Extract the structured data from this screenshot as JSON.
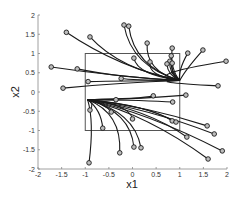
{
  "chart_data": {
    "type": "line",
    "title": "",
    "xlabel": "x1",
    "ylabel": "x2",
    "xlim": [
      -2,
      2
    ],
    "ylim": [
      -2,
      2
    ],
    "xticks": [
      "-2",
      "-1.5",
      "-1",
      "-0.5",
      "0",
      "0.5",
      "1",
      "1.5",
      "2"
    ],
    "yticks": [
      "2",
      "1.5",
      "1",
      "0.5",
      "0",
      "-0.5",
      "-1",
      "-1.5",
      "-2"
    ],
    "grid": false,
    "legend": null,
    "region_box": {
      "x": [
        -1,
        1
      ],
      "y": [
        -1,
        1
      ]
    },
    "attractors": [
      {
        "name": "upper-right",
        "x": 1.0,
        "y": 0.3
      },
      {
        "name": "lower-left",
        "x": -0.95,
        "y": -0.2
      }
    ],
    "trajectories": [
      {
        "start": [
          -1.4,
          1.55
        ],
        "end": [
          1.0,
          0.3
        ]
      },
      {
        "start": [
          -0.18,
          1.74
        ],
        "end": [
          1.0,
          0.3
        ]
      },
      {
        "start": [
          -0.08,
          1.71
        ],
        "end": [
          1.0,
          0.3
        ]
      },
      {
        "start": [
          0.31,
          1.27
        ],
        "end": [
          1.0,
          0.3
        ]
      },
      {
        "start": [
          0.84,
          1.14
        ],
        "end": [
          1.0,
          0.3
        ]
      },
      {
        "start": [
          1.17,
          1.01
        ],
        "end": [
          1.0,
          0.3
        ]
      },
      {
        "start": [
          1.49,
          1.09
        ],
        "end": [
          1.0,
          0.3
        ]
      },
      {
        "start": [
          1.98,
          0.8
        ],
        "end": [
          1.0,
          0.3
        ]
      },
      {
        "start": [
          0.03,
          0.88
        ],
        "end": [
          1.0,
          0.3
        ]
      },
      {
        "start": [
          0.37,
          0.78
        ],
        "end": [
          1.0,
          0.3
        ]
      },
      {
        "start": [
          0.82,
          0.94
        ],
        "end": [
          1.0,
          0.3
        ]
      },
      {
        "start": [
          0.79,
          0.8
        ],
        "end": [
          1.0,
          0.3
        ]
      },
      {
        "start": [
          0.73,
          0.73
        ],
        "end": [
          1.0,
          0.3
        ]
      },
      {
        "start": [
          0.84,
          0.75
        ],
        "end": [
          1.0,
          0.3
        ]
      },
      {
        "start": [
          -0.9,
          1.43
        ],
        "end": [
          1.0,
          0.3
        ]
      },
      {
        "start": [
          -1.72,
          0.65
        ],
        "end": [
          1.0,
          0.3
        ]
      },
      {
        "start": [
          -1.17,
          0.6
        ],
        "end": [
          1.0,
          0.3
        ]
      },
      {
        "start": [
          -0.94,
          0.27
        ],
        "end": [
          1.0,
          0.3
        ]
      },
      {
        "start": [
          -1.47,
          0.1
        ],
        "end": [
          1.0,
          0.3
        ]
      },
      {
        "start": [
          -0.24,
          0.35
        ],
        "end": [
          1.0,
          0.3
        ]
      },
      {
        "start": [
          1.81,
          0.16
        ],
        "end": [
          1.0,
          0.3
        ]
      },
      {
        "start": [
          1.13,
          -0.08
        ],
        "end": [
          -0.95,
          -0.2
        ]
      },
      {
        "start": [
          0.44,
          -0.1
        ],
        "end": [
          -0.95,
          -0.2
        ]
      },
      {
        "start": [
          0.85,
          -0.26
        ],
        "end": [
          -0.95,
          -0.2
        ]
      },
      {
        "start": [
          0.84,
          -0.75
        ],
        "end": [
          -0.95,
          -0.2
        ]
      },
      {
        "start": [
          0.92,
          -0.78
        ],
        "end": [
          -0.95,
          -0.2
        ]
      },
      {
        "start": [
          1.58,
          -0.88
        ],
        "end": [
          -0.95,
          -0.2
        ]
      },
      {
        "start": [
          1.73,
          -1.09
        ],
        "end": [
          -0.95,
          -0.2
        ]
      },
      {
        "start": [
          1.15,
          -1.17
        ],
        "end": [
          -0.95,
          -0.2
        ]
      },
      {
        "start": [
          1.9,
          -1.53
        ],
        "end": [
          -0.95,
          -0.2
        ]
      },
      {
        "start": [
          1.6,
          -1.74
        ],
        "end": [
          -0.95,
          -0.2
        ]
      },
      {
        "start": [
          -0.35,
          -0.2
        ],
        "end": [
          -0.95,
          -0.2
        ]
      },
      {
        "start": [
          -0.9,
          -0.47
        ],
        "end": [
          -0.95,
          -0.2
        ]
      },
      {
        "start": [
          -0.45,
          -0.52
        ],
        "end": [
          -0.95,
          -0.2
        ]
      },
      {
        "start": [
          0.0,
          -0.7
        ],
        "end": [
          -0.95,
          -0.2
        ]
      },
      {
        "start": [
          -0.63,
          -0.94
        ],
        "end": [
          -0.95,
          -0.2
        ]
      },
      {
        "start": [
          -0.27,
          -1.58
        ],
        "end": [
          -0.95,
          -0.2
        ]
      },
      {
        "start": [
          0.03,
          -1.43
        ],
        "end": [
          -0.95,
          -0.2
        ]
      },
      {
        "start": [
          0.18,
          -1.45
        ],
        "end": [
          -0.95,
          -0.2
        ]
      },
      {
        "start": [
          -0.92,
          -1.84
        ],
        "end": [
          -0.95,
          -0.2
        ]
      }
    ]
  }
}
